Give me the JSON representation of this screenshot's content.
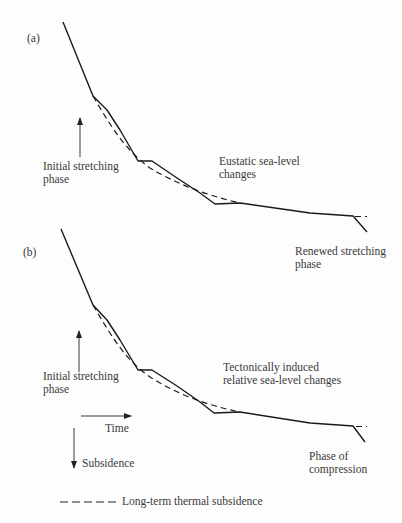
{
  "panels": [
    {
      "label": "(a)",
      "left_annotation": [
        "Initial stretching",
        "phase"
      ],
      "middle_annotation": [
        "Eustatic sea-level",
        "changes"
      ],
      "right_annotation": [
        "Renewed stretching",
        "phase"
      ]
    },
    {
      "label": "(b)",
      "left_annotation": [
        "Initial stretching",
        "phase"
      ],
      "middle_annotation": [
        "Tectonically induced",
        "relative sea-level changes"
      ],
      "right_annotation": [
        "Phase of",
        "compression"
      ]
    }
  ],
  "axes": {
    "x_label": "Time",
    "y_label": "Subsidence"
  },
  "legend": {
    "dashed_label": "Long-term thermal subsidence"
  },
  "colors": {
    "line": "#1a1a1a",
    "text": "#3a3a3a"
  }
}
